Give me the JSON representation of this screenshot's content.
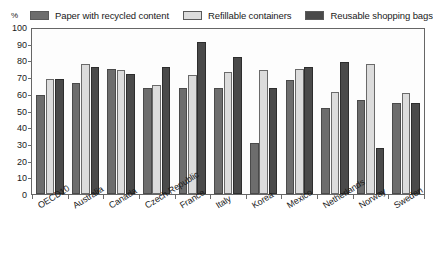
{
  "axis_unit": "%",
  "legend": {
    "position": "top",
    "items": [
      {
        "label": "Paper with recycled content",
        "color": "#6d6d6d",
        "swatch": "legend-swatch-paper"
      },
      {
        "label": "Refillable containers",
        "color": "#dcdcdc",
        "swatch": "legend-swatch-refillable"
      },
      {
        "label": "Reusable shopping bags",
        "color": "#4a4a4a",
        "swatch": "legend-swatch-bags"
      }
    ]
  },
  "chart_data": {
    "type": "bar",
    "title": "",
    "xlabel": "",
    "ylabel": "%",
    "ylim": [
      0,
      100
    ],
    "yticks": [
      0,
      10,
      20,
      30,
      40,
      50,
      60,
      70,
      80,
      90,
      100
    ],
    "grid": false,
    "legend_position": "top",
    "categories": [
      "OECD10",
      "Australia",
      "Canada",
      "Czech Republic",
      "France",
      "Italy",
      "Korea",
      "Mexico",
      "Netherlands",
      "Norway",
      "Sweden"
    ],
    "series": [
      {
        "name": "Paper with recycled content",
        "color": "#6d6d6d",
        "values": [
          60,
          67,
          76,
          64,
          64,
          64,
          31,
          69,
          52,
          57,
          55
        ]
      },
      {
        "name": "Refillable containers",
        "color": "#dcdcdc",
        "values": [
          70,
          79,
          75,
          66,
          72,
          74,
          75,
          76,
          62,
          79,
          61
        ]
      },
      {
        "name": "Reusable shopping bags",
        "color": "#4a4a4a",
        "values": [
          70,
          77,
          73,
          77,
          92,
          83,
          64,
          77,
          80,
          28,
          55
        ]
      }
    ]
  }
}
